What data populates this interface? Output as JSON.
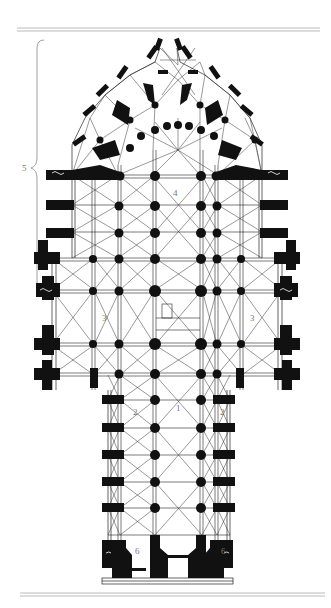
{
  "figure": {
    "type": "cathedral floor plan",
    "rule_color": "#aaaaaa",
    "ink_color": "#111111",
    "bracket_label": "5",
    "labels": [
      {
        "id": "nave",
        "text": "1",
        "x": 178,
        "y": 408
      },
      {
        "id": "aisle-left",
        "text": "2",
        "x": 135,
        "y": 412
      },
      {
        "id": "aisle-right",
        "text": "2",
        "x": 222,
        "y": 412
      },
      {
        "id": "transept-left",
        "text": "3",
        "x": 104,
        "y": 318
      },
      {
        "id": "transept-right",
        "text": "3",
        "x": 252,
        "y": 318
      },
      {
        "id": "choir",
        "text": "4",
        "x": 175,
        "y": 193
      },
      {
        "id": "tower-left",
        "text": "6",
        "x": 137,
        "y": 551
      },
      {
        "id": "tower-right",
        "text": "6",
        "x": 223,
        "y": 551
      }
    ]
  }
}
